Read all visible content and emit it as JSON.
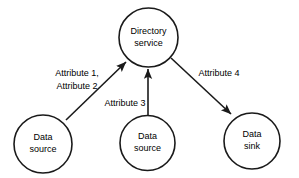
{
  "diagram": {
    "background_color": "#ffffff",
    "stroke_color": "#1a1a1a",
    "text_color": "#000000",
    "nodes": [
      {
        "id": "directory-service",
        "shape": "circle",
        "line1": "Directory",
        "line2": "service",
        "cx": 148.5,
        "cy": 37.5,
        "r": 29.5
      },
      {
        "id": "data-source-left",
        "shape": "circle",
        "line1": "Data",
        "line2": "source",
        "cx": 43,
        "cy": 144,
        "r": 29
      },
      {
        "id": "data-source-middle",
        "shape": "circle",
        "line1": "Data",
        "line2": "source",
        "cx": 147.5,
        "cy": 143,
        "r": 27.5
      },
      {
        "id": "data-sink-right",
        "shape": "circle",
        "line1": "Data",
        "line2": "sink",
        "cx": 252,
        "cy": 141,
        "r": 28
      }
    ],
    "edges": [
      {
        "id": "edge-attribute-1-2",
        "from": "data-source-left",
        "to": "directory-service",
        "label_line1": "Attribute 1,",
        "label_line2": "Attribute 2",
        "label_x": 77,
        "label_y1": 74,
        "label_y2": 87,
        "x1": 66,
        "y1": 120,
        "x2": 126,
        "y2": 62
      },
      {
        "id": "edge-attribute-3",
        "from": "data-source-middle",
        "to": "directory-service",
        "label_line1": "Attribute 3",
        "label_line2": "",
        "label_x": 125,
        "label_y1": 104,
        "label_y2": 0,
        "x1": 148,
        "y1": 115,
        "x2": 148,
        "y2": 69
      },
      {
        "id": "edge-attribute-4",
        "from": "directory-service",
        "to": "data-sink-right",
        "label_line1": "Attribute 4",
        "label_line2": "",
        "label_x": 219,
        "label_y1": 74,
        "label_y2": 0,
        "x1": 171,
        "y1": 58,
        "x2": 231,
        "y2": 114
      }
    ]
  }
}
